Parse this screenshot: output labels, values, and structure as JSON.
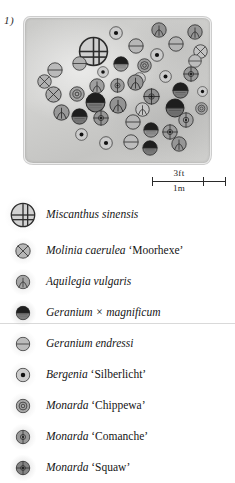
{
  "figure": {
    "number": "1)"
  },
  "scale": {
    "imperial": "3ft",
    "metric": "1m"
  },
  "legend": {
    "items": [
      {
        "name_italic": "Miscanthus sinensis",
        "name_roman": "",
        "symbol": "grid-circle",
        "size": 26,
        "tone": 0.0
      },
      {
        "name_italic": "Molinia caerulea",
        "name_roman": "‘Moorhexe’",
        "symbol": "x-circle",
        "size": 16,
        "tone": 0.18
      },
      {
        "name_italic": "Aquilegia vulgaris",
        "name_roman": "",
        "symbol": "arch-circle",
        "size": 15,
        "tone": 0.3
      },
      {
        "name_italic": "Geranium × magnificum",
        "name_roman": "",
        "symbol": "halffill-circle",
        "size": 15,
        "tone": 0.55
      },
      {
        "name_italic": "Geranium endressi",
        "name_roman": "",
        "symbol": "hline-circle",
        "size": 15,
        "tone": 0.15
      },
      {
        "name_italic": "Bergenia",
        "name_roman": "‘Silberlicht’",
        "symbol": "dot-circle",
        "size": 15,
        "tone": 0.05
      },
      {
        "name_italic": "Monarda",
        "name_roman": "‘Chippewa’",
        "symbol": "ring-circle",
        "size": 15,
        "tone": 0.28
      },
      {
        "name_italic": "Monarda",
        "name_roman": "‘Comanche’",
        "symbol": "vdot-circle",
        "size": 15,
        "tone": 0.38
      },
      {
        "name_italic": "Monarda",
        "name_roman": "‘Squaw’",
        "symbol": "cross-dot-circle",
        "size": 15,
        "tone": 0.52
      }
    ]
  },
  "plan": {
    "symbols": [
      {
        "symbol": "dot-circle",
        "x": 84,
        "y": 8,
        "d": 14,
        "tone": 0.04
      },
      {
        "symbol": "arch-circle",
        "x": 126,
        "y": 4,
        "d": 16,
        "tone": 0.42
      },
      {
        "symbol": "arch-circle",
        "x": 162,
        "y": 6,
        "d": 16,
        "tone": 0.4
      },
      {
        "symbol": "grid-circle",
        "x": 53,
        "y": 18,
        "d": 31,
        "tone": 0.02
      },
      {
        "symbol": "hline-circle",
        "x": 103,
        "y": 20,
        "d": 16,
        "tone": 0.18
      },
      {
        "symbol": "hline-circle",
        "x": 143,
        "y": 18,
        "d": 16,
        "tone": 0.2
      },
      {
        "symbol": "x-circle",
        "x": 168,
        "y": 26,
        "d": 15,
        "tone": 0.1
      },
      {
        "symbol": "dot-circle",
        "x": 125,
        "y": 30,
        "d": 14,
        "tone": 0.05
      },
      {
        "symbol": "hline-circle",
        "x": 22,
        "y": 44,
        "d": 16,
        "tone": 0.16
      },
      {
        "symbol": "hline-circle",
        "x": 47,
        "y": 38,
        "d": 15,
        "tone": 0.22
      },
      {
        "symbol": "dot-circle",
        "x": 72,
        "y": 48,
        "d": 12,
        "tone": 0.04
      },
      {
        "symbol": "halffill-circle",
        "x": 88,
        "y": 38,
        "d": 16,
        "tone": 0.35
      },
      {
        "symbol": "ring-circle",
        "x": 112,
        "y": 40,
        "d": 15,
        "tone": 0.34
      },
      {
        "symbol": "dot-circle",
        "x": 108,
        "y": 54,
        "d": 13,
        "tone": 0.04
      },
      {
        "symbol": "dot-circle",
        "x": 134,
        "y": 52,
        "d": 13,
        "tone": 0.04
      },
      {
        "symbol": "cross-dot-circle",
        "x": 158,
        "y": 48,
        "d": 16,
        "tone": 0.38
      },
      {
        "symbol": "x-circle",
        "x": 20,
        "y": 68,
        "d": 17,
        "tone": 0.26
      },
      {
        "symbol": "ring-circle",
        "x": 44,
        "y": 68,
        "d": 16,
        "tone": 0.3
      },
      {
        "symbol": "arch-circle",
        "x": 64,
        "y": 60,
        "d": 16,
        "tone": 0.34
      },
      {
        "symbol": "vdot-circle",
        "x": 85,
        "y": 60,
        "d": 15,
        "tone": 0.36
      },
      {
        "symbol": "arch-circle",
        "x": 102,
        "y": 56,
        "d": 17,
        "tone": 0.4
      },
      {
        "symbol": "halffill-circle",
        "x": 60,
        "y": 74,
        "d": 21,
        "tone": 0.6
      },
      {
        "symbol": "cross-dot-circle",
        "x": 118,
        "y": 70,
        "d": 17,
        "tone": 0.44
      },
      {
        "symbol": "halffill-circle",
        "x": 147,
        "y": 64,
        "d": 17,
        "tone": 0.58
      },
      {
        "symbol": "dot-circle",
        "x": 172,
        "y": 68,
        "d": 11,
        "tone": 0.04
      },
      {
        "symbol": "arch-circle",
        "x": 28,
        "y": 86,
        "d": 17,
        "tone": 0.38
      },
      {
        "symbol": "halffill-circle",
        "x": 46,
        "y": 90,
        "d": 17,
        "tone": 0.62
      },
      {
        "symbol": "arch-circle",
        "x": 84,
        "y": 78,
        "d": 18,
        "tone": 0.42
      },
      {
        "symbol": "cross-dot-circle",
        "x": 68,
        "y": 92,
        "d": 16,
        "tone": 0.4
      },
      {
        "symbol": "arch-circle",
        "x": 110,
        "y": 84,
        "d": 15,
        "tone": 0.08
      },
      {
        "symbol": "halffill-circle",
        "x": 140,
        "y": 80,
        "d": 20,
        "tone": 0.66
      },
      {
        "symbol": "ring-circle",
        "x": 170,
        "y": 84,
        "d": 13,
        "tone": 0.3
      },
      {
        "symbol": "hline-circle",
        "x": 100,
        "y": 96,
        "d": 16,
        "tone": 0.18
      },
      {
        "symbol": "vdot-circle",
        "x": 153,
        "y": 94,
        "d": 16,
        "tone": 0.32
      },
      {
        "symbol": "dot-circle",
        "x": 50,
        "y": 110,
        "d": 13,
        "tone": 0.04
      },
      {
        "symbol": "halffill-circle",
        "x": 118,
        "y": 104,
        "d": 16,
        "tone": 0.4
      },
      {
        "symbol": "cross-dot-circle",
        "x": 137,
        "y": 106,
        "d": 16,
        "tone": 0.36
      },
      {
        "symbol": "dot-circle",
        "x": 74,
        "y": 118,
        "d": 14,
        "tone": 0.04
      },
      {
        "symbol": "hline-circle",
        "x": 98,
        "y": 116,
        "d": 16,
        "tone": 0.14
      },
      {
        "symbol": "halffill-circle",
        "x": 117,
        "y": 122,
        "d": 16,
        "tone": 0.58
      },
      {
        "symbol": "arch-circle",
        "x": 146,
        "y": 118,
        "d": 16,
        "tone": 0.4
      },
      {
        "symbol": "hline-circle",
        "x": 163,
        "y": 36,
        "d": 14,
        "tone": 0.14
      },
      {
        "symbol": "x-circle",
        "x": 12,
        "y": 56,
        "d": 15,
        "tone": 0.22
      }
    ]
  }
}
